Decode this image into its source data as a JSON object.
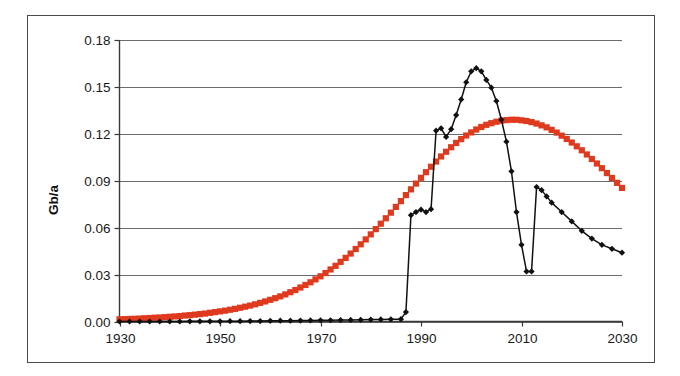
{
  "chart_data": {
    "type": "line",
    "title": "",
    "xlabel": "",
    "ylabel": "Gb/a",
    "xlim": [
      1930,
      2030
    ],
    "ylim": [
      0.0,
      0.18
    ],
    "xticks": [
      1930,
      1950,
      1970,
      1990,
      2010,
      2030
    ],
    "yticks": [
      0.0,
      0.03,
      0.06,
      0.09,
      0.12,
      0.15,
      0.18
    ],
    "ytick_labels": [
      "0.00",
      "0.03",
      "0.06",
      "0.09",
      "0.12",
      "0.15",
      "0.18"
    ],
    "xtick_labels": [
      "1930",
      "1950",
      "1970",
      "1990",
      "2010",
      "2030"
    ],
    "grid": "horizontal",
    "legend": "none",
    "series": [
      {
        "name": "model-curve",
        "style": "square-markers",
        "color": "#e03a1e",
        "x": [
          1930,
          1931,
          1932,
          1933,
          1934,
          1935,
          1936,
          1937,
          1938,
          1939,
          1940,
          1941,
          1942,
          1943,
          1944,
          1945,
          1946,
          1947,
          1948,
          1949,
          1950,
          1951,
          1952,
          1953,
          1954,
          1955,
          1956,
          1957,
          1958,
          1959,
          1960,
          1961,
          1962,
          1963,
          1964,
          1965,
          1966,
          1967,
          1968,
          1969,
          1970,
          1971,
          1972,
          1973,
          1974,
          1975,
          1976,
          1977,
          1978,
          1979,
          1980,
          1981,
          1982,
          1983,
          1984,
          1985,
          1986,
          1987,
          1988,
          1989,
          1990,
          1991,
          1992,
          1993,
          1994,
          1995,
          1996,
          1997,
          1998,
          1999,
          2000,
          2001,
          2002,
          2003,
          2004,
          2005,
          2006,
          2007,
          2008,
          2009,
          2010,
          2011,
          2012,
          2013,
          2014,
          2015,
          2016,
          2017,
          2018,
          2019,
          2020,
          2021,
          2022,
          2023,
          2024,
          2025,
          2026,
          2027,
          2028,
          2029,
          2030
        ],
        "y": [
          0.0012,
          0.0013,
          0.0014,
          0.0015,
          0.0016,
          0.0018,
          0.0019,
          0.0021,
          0.0022,
          0.0024,
          0.0026,
          0.0028,
          0.003,
          0.0033,
          0.0035,
          0.0038,
          0.0041,
          0.0044,
          0.0048,
          0.0052,
          0.0056,
          0.006,
          0.0065,
          0.007,
          0.0076,
          0.0082,
          0.0088,
          0.0095,
          0.0103,
          0.0111,
          0.012,
          0.0129,
          0.0139,
          0.015,
          0.0162,
          0.0174,
          0.0188,
          0.0202,
          0.0217,
          0.0233,
          0.025,
          0.0268,
          0.0288,
          0.0308,
          0.033,
          0.0352,
          0.0376,
          0.0401,
          0.0427,
          0.0454,
          0.0482,
          0.0511,
          0.0541,
          0.0571,
          0.0602,
          0.0634,
          0.0666,
          0.0699,
          0.0731,
          0.0763,
          0.0795,
          0.0826,
          0.0856,
          0.0885,
          0.0913,
          0.0939,
          0.0964,
          0.0988,
          0.1009,
          0.1029,
          0.1046,
          0.1062,
          0.1076,
          0.1088,
          0.1097,
          0.1105,
          0.1111,
          0.1114,
          0.1116,
          0.1116,
          0.1113,
          0.1109,
          0.1103,
          0.1095,
          0.1085,
          0.1074,
          0.106,
          0.1045,
          0.1028,
          0.101,
          0.099,
          0.0969,
          0.0947,
          0.0924,
          0.0899,
          0.0874,
          0.0848,
          0.0821,
          0.0794,
          0.0767,
          0.0739
        ],
        "y_scaled_note": "peak 0.129 at 2001"
      },
      {
        "name": "production-history",
        "style": "diamond-markers-line",
        "color": "#111111",
        "x": [
          1930,
          1932,
          1934,
          1936,
          1938,
          1940,
          1942,
          1944,
          1946,
          1948,
          1950,
          1952,
          1954,
          1956,
          1958,
          1960,
          1962,
          1964,
          1966,
          1968,
          1970,
          1972,
          1974,
          1976,
          1978,
          1980,
          1982,
          1984,
          1986,
          1987,
          1988,
          1989,
          1990,
          1991,
          1992,
          1993,
          1994,
          1995,
          1996,
          1997,
          1998,
          1999,
          2000,
          2001,
          2002,
          2003,
          2004,
          2005,
          2006,
          2007,
          2008,
          2009,
          2010,
          2011,
          2012,
          2013,
          2014,
          2015,
          2016,
          2018,
          2020,
          2022,
          2024,
          2026,
          2028,
          2030
        ],
        "y": [
          0.0,
          0.0,
          0.0,
          0.0,
          0.0,
          0.0,
          0.0,
          0.0001,
          0.0001,
          0.0001,
          0.0001,
          0.0002,
          0.0002,
          0.0003,
          0.0003,
          0.0004,
          0.0005,
          0.0005,
          0.0006,
          0.0007,
          0.0008,
          0.0008,
          0.0009,
          0.001,
          0.0011,
          0.0012,
          0.0013,
          0.0014,
          0.0015,
          0.006,
          0.068,
          0.07,
          0.0715,
          0.07,
          0.0718,
          0.122,
          0.1235,
          0.118,
          0.123,
          0.132,
          0.142,
          0.153,
          0.16,
          0.162,
          0.16,
          0.1545,
          0.1495,
          0.141,
          0.129,
          0.115,
          0.096,
          0.07,
          0.049,
          0.032,
          0.032,
          0.086,
          0.084,
          0.08,
          0.076,
          0.07,
          0.064,
          0.058,
          0.053,
          0.049,
          0.0465,
          0.044
        ]
      }
    ],
    "annotations": [
      {
        "text": "black curve peak",
        "x": 2001,
        "y": 0.162
      },
      {
        "text": "red curve peak",
        "x": 2001,
        "y": 0.129
      },
      {
        "text": "sharp dip",
        "x": 2011,
        "y": 0.032
      }
    ]
  },
  "figure": {
    "background_color": "#ffffff",
    "frame_color": "#4a4a4a",
    "grid_color": "#6b6b6b",
    "axis_color": "#3a3a3a"
  }
}
